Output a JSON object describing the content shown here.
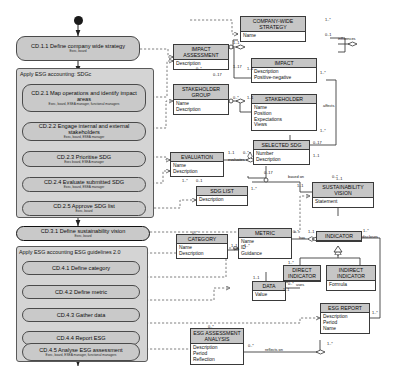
{
  "diagram": {
    "type": "uml-activity-class-diagram",
    "colors": {
      "activity_fill": "#c9c9c9",
      "pool_fill": "#d4d4d4",
      "class_header_fill": "#c6c6c6",
      "class_body_fill": "#ffffff",
      "line": "#3a3a3a",
      "background": "#ffffff"
    }
  },
  "activity": {
    "start_node": "filled-circle-start",
    "pools": [
      {
        "label": "Apply ESG accounting: SDGc"
      },
      {
        "label": "Apply ESG accounting ESG guidelines 2.0"
      }
    ],
    "steps": [
      {
        "id": "CD.1.1",
        "label": "CD.1.1 Define company wide strategy",
        "roles": "Exec, board"
      },
      {
        "id": "CD.2.1",
        "label": "CD.2.1 Map operations and identify impact areas",
        "roles": "Exec, board, ESEA manager, functional managers"
      },
      {
        "id": "CD.2.2",
        "label": "CD.2.2 Engage internal and external stakeholders",
        "roles": "Exec, board, ESEA manager"
      },
      {
        "id": "CD.2.3",
        "label": "CD.2.3 Prioritise SDG",
        "roles": "Exec board, ESEA manager"
      },
      {
        "id": "CD.2.4",
        "label": "CD.2.4 Evaluate submitted SDG",
        "roles": "Exec, board, ESEA manager"
      },
      {
        "id": "CD.2.5",
        "label": "CD.2.5 Approve SDG list",
        "roles": "Exec, board"
      },
      {
        "id": "CD.3.1",
        "label": "CD.3.1 Define sustainability vision",
        "roles": "Exec, board"
      },
      {
        "id": "CD.4.1",
        "label": "CD.4.1 Define category",
        "roles": ""
      },
      {
        "id": "CD.4.2",
        "label": "CD.4.2 Define metric",
        "roles": ""
      },
      {
        "id": "CD.4.3",
        "label": "CD.4.3 Gather data",
        "roles": ""
      },
      {
        "id": "CD.4.4",
        "label": "CD.4.4 Report ESG",
        "roles": ""
      },
      {
        "id": "CD.4.5",
        "label": "CD.4.5 Analyse ESG assessment",
        "roles": "Exec, board, ESEA manager, functional managers"
      }
    ]
  },
  "classes": [
    {
      "key": "impact_assessment",
      "name": "IMPACT ASSESSMENT",
      "attrs": [
        "Description"
      ]
    },
    {
      "key": "stakeholder_group",
      "name": "STAKEHOLDER GROUP",
      "attrs": [
        "Name",
        "Description"
      ]
    },
    {
      "key": "company_wide_strategy",
      "name": "COMPANY-WIDE STRATEGY",
      "attrs": [
        "Name"
      ]
    },
    {
      "key": "impact",
      "name": "IMPACT",
      "attrs": [
        "Description",
        "Positive-negative"
      ]
    },
    {
      "key": "stakeholder",
      "name": "STAKEHOLDER",
      "attrs": [
        "Name",
        "Position",
        "Expectations",
        "Views"
      ]
    },
    {
      "key": "evaluation",
      "name": "EVALUATION",
      "attrs": [
        "Name",
        "Description"
      ]
    },
    {
      "key": "selected_sdg",
      "name": "SELECTED SDG",
      "attrs": [
        "Number",
        "Description"
      ]
    },
    {
      "key": "sdg_list",
      "name": "SDG LIST",
      "attrs": [
        "Description"
      ]
    },
    {
      "key": "sustainability_vision",
      "name": "SUSTAINABILITY VISION",
      "attrs": [
        "Statement"
      ]
    },
    {
      "key": "category",
      "name": "CATEGORY",
      "attrs": [
        "Name",
        "Description"
      ]
    },
    {
      "key": "metric",
      "name": "METRIC",
      "attrs": [
        "Name",
        "ID",
        "Guidance"
      ]
    },
    {
      "key": "indicator",
      "name": "INDICATOR",
      "attrs": []
    },
    {
      "key": "direct_indicator",
      "name": "DIRECT INDICATOR",
      "attrs": []
    },
    {
      "key": "indirect_indicator",
      "name": "INDIRECT INDICATOR",
      "attrs": [
        "Formula"
      ]
    },
    {
      "key": "data",
      "name": "DATA",
      "attrs": [
        "Value"
      ]
    },
    {
      "key": "esg_report",
      "name": "ESG REPORT",
      "attrs": [
        "Description",
        "Period",
        "Name"
      ]
    },
    {
      "key": "esg_assessment_analysis",
      "name": "ESG ASSESSMENT ANALYSIS",
      "attrs": [
        "Description",
        "Period",
        "Reflection"
      ]
    }
  ],
  "relationships": {
    "labels": [
      {
        "key": "influences",
        "text": "influences"
      },
      {
        "key": "affects",
        "text": "affects"
      },
      {
        "key": "evaluates",
        "text": "evaluates"
      },
      {
        "key": "based_on",
        "text": "based on"
      },
      {
        "key": "has_metric",
        "text": "has"
      },
      {
        "key": "has_indicator",
        "text": "has"
      },
      {
        "key": "discloses",
        "text": "discloses"
      },
      {
        "key": "uses",
        "text": "uses"
      },
      {
        "key": "reflects_on",
        "text": "reflects on"
      }
    ],
    "multiplicities": [
      {
        "key": "m1",
        "text": "1..1"
      },
      {
        "key": "m2",
        "text": "1..*"
      },
      {
        "key": "m3",
        "text": "0..1"
      },
      {
        "key": "m4",
        "text": "0..*"
      },
      {
        "key": "m5",
        "text": "0..17"
      },
      {
        "key": "m6",
        "text": "1..17"
      },
      {
        "key": "m7",
        "text": "1..1"
      },
      {
        "key": "m8",
        "text": "1..*"
      },
      {
        "key": "m9",
        "text": "0..*"
      },
      {
        "key": "m10",
        "text": "1..1"
      },
      {
        "key": "m11",
        "text": "1..*"
      },
      {
        "key": "m12",
        "text": "0..17"
      },
      {
        "key": "m13",
        "text": "1..1"
      },
      {
        "key": "m14",
        "text": "0..*"
      },
      {
        "key": "m15",
        "text": "1..1"
      },
      {
        "key": "m16",
        "text": "1..*"
      },
      {
        "key": "m17",
        "text": "0..1"
      },
      {
        "key": "m18",
        "text": "1..*"
      },
      {
        "key": "m19",
        "text": "1..1"
      },
      {
        "key": "m20",
        "text": "0..*"
      },
      {
        "key": "m21",
        "text": "0..17"
      },
      {
        "key": "m22",
        "text": "1..1"
      },
      {
        "key": "m23",
        "text": "1..*"
      },
      {
        "key": "m24",
        "text": "0..*"
      },
      {
        "key": "m25",
        "text": "1..1"
      },
      {
        "key": "m26",
        "text": "1..*"
      },
      {
        "key": "m27",
        "text": "0..*"
      },
      {
        "key": "m28",
        "text": "1..1"
      },
      {
        "key": "m29",
        "text": "1..1"
      },
      {
        "key": "m30",
        "text": "1..*"
      },
      {
        "key": "m31",
        "text": "0..*"
      },
      {
        "key": "m32",
        "text": "1..*"
      },
      {
        "key": "m33",
        "text": "0..*"
      },
      {
        "key": "m34",
        "text": "1..*"
      },
      {
        "key": "m35",
        "text": "0..*"
      },
      {
        "key": "m36",
        "text": "1..1"
      }
    ]
  }
}
